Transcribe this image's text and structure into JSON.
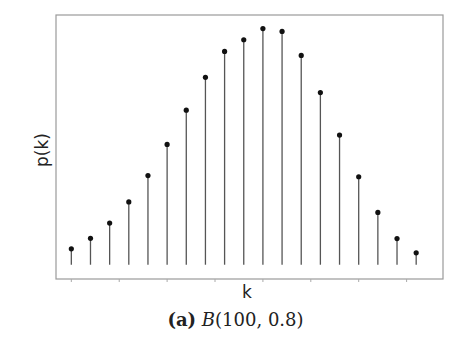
{
  "chart_data": {
    "type": "stem",
    "title": "",
    "caption": {
      "tag": "(a)",
      "dist_name": "B",
      "params": "(100, 0.8)"
    },
    "xlabel": "k",
    "ylabel": "p(k)",
    "x": [
      70,
      71,
      72,
      73,
      74,
      75,
      76,
      77,
      78,
      79,
      80,
      81,
      82,
      83,
      84,
      85,
      86,
      87,
      88
    ],
    "values": [
      0.0067,
      0.0111,
      0.0175,
      0.0264,
      0.0375,
      0.0506,
      0.065,
      0.0788,
      0.0897,
      0.0946,
      0.0993,
      0.0981,
      0.088,
      0.0724,
      0.0545,
      0.037,
      0.022,
      0.011,
      0.005
    ],
    "xlim": [
      69.2,
      89.4
    ],
    "ylim": [
      -0.006,
      0.105
    ],
    "x_ticks": [
      70,
      72.5,
      75,
      77.5,
      80,
      82.5,
      85,
      87.5
    ],
    "show_tick_labels": false,
    "grid": false,
    "legend": null,
    "colors": {
      "stem": "#555555",
      "marker": "#111111",
      "frame": "#9a9a9a"
    }
  }
}
